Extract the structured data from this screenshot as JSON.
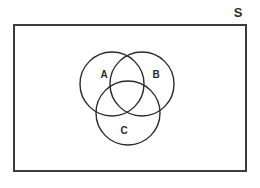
{
  "diagram": {
    "type": "venn-diagram",
    "sets_count": 3,
    "universe": {
      "label": "S",
      "label_name": "universal-set-label",
      "rect": {
        "x": 14,
        "y": 25,
        "width": 232,
        "height": 146
      },
      "stroke": "#3b3b3b",
      "stroke_width": 2,
      "fill": "#ffffff",
      "label_position": {
        "x": 238,
        "y": 14
      },
      "label_font_size": 13
    },
    "circles": [
      {
        "label": "A",
        "cx": 112,
        "cy": 84,
        "r": 32,
        "stroke": "#2b2b2b",
        "stroke_width": 1.4,
        "label_x": 104,
        "label_y": 75,
        "label_font_size": 10
      },
      {
        "label": "B",
        "cx": 142,
        "cy": 84,
        "r": 32,
        "stroke": "#2b2b2b",
        "stroke_width": 1.4,
        "label_x": 156,
        "label_y": 75,
        "label_font_size": 10
      },
      {
        "label": "C",
        "cx": 128,
        "cy": 113,
        "r": 32,
        "stroke": "#2b2b2b",
        "stroke_width": 1.4,
        "label_x": 124,
        "label_y": 131,
        "label_font_size": 10
      }
    ]
  }
}
